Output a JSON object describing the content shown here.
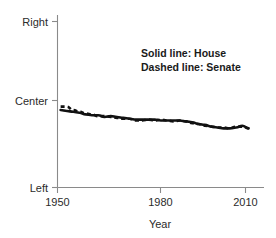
{
  "chart_data": {
    "type": "line",
    "title": "",
    "xlabel": "Year",
    "ylabel": "",
    "xlim": [
      1949,
      2012
    ],
    "ylim": [
      -1,
      1
    ],
    "grid": false,
    "legend_position": "upper-right-inside",
    "x_ticks": [
      1950,
      1980,
      2010
    ],
    "x_tick_labels": [
      "1950",
      "1980",
      "2010"
    ],
    "y_ticks": [
      1,
      0,
      -1
    ],
    "y_tick_labels": [
      "Right",
      "Center",
      "Left"
    ],
    "annotations": [
      "Solid line: House",
      "Dashed line: Senate"
    ],
    "series": [
      {
        "name": "House",
        "style": "solid",
        "color": "#111111",
        "x": [
          1951,
          1953,
          1955,
          1957,
          1959,
          1961,
          1963,
          1965,
          1967,
          1969,
          1971,
          1973,
          1975,
          1977,
          1979,
          1981,
          1983,
          1985,
          1987,
          1989,
          1991,
          1993,
          1995,
          1997,
          1999,
          2001,
          2003,
          2005,
          2007,
          2009,
          2011
        ],
        "values": [
          -0.11,
          -0.12,
          -0.13,
          -0.14,
          -0.16,
          -0.17,
          -0.17,
          -0.19,
          -0.18,
          -0.19,
          -0.2,
          -0.21,
          -0.22,
          -0.22,
          -0.22,
          -0.22,
          -0.23,
          -0.23,
          -0.23,
          -0.23,
          -0.24,
          -0.25,
          -0.27,
          -0.28,
          -0.3,
          -0.31,
          -0.32,
          -0.32,
          -0.31,
          -0.29,
          -0.32
        ]
      },
      {
        "name": "Senate",
        "style": "dashed",
        "color": "#111111",
        "x": [
          1951,
          1953,
          1955,
          1957,
          1959,
          1961,
          1963,
          1965,
          1967,
          1969,
          1971,
          1973,
          1975,
          1977,
          1979,
          1981,
          1983,
          1985,
          1987,
          1989,
          1991,
          1993,
          1995,
          1997,
          1999,
          2001,
          2003,
          2005,
          2007,
          2009,
          2011
        ],
        "values": [
          -0.07,
          -0.07,
          -0.11,
          -0.13,
          -0.15,
          -0.16,
          -0.18,
          -0.18,
          -0.19,
          -0.2,
          -0.21,
          -0.21,
          -0.23,
          -0.23,
          -0.22,
          -0.23,
          -0.22,
          -0.23,
          -0.24,
          -0.23,
          -0.24,
          -0.26,
          -0.27,
          -0.29,
          -0.3,
          -0.31,
          -0.31,
          -0.32,
          -0.3,
          -0.3,
          -0.32
        ]
      }
    ]
  },
  "axes": {
    "x_title": "Year",
    "y_top_label": "Right",
    "y_mid_label": "Center",
    "y_bottom_label": "Left",
    "x_tick_1": "1950",
    "x_tick_2": "1980",
    "x_tick_3": "2010"
  },
  "legend": {
    "line_1": "Solid line: House",
    "line_2": "Dashed line: Senate"
  },
  "colors": {
    "line": "#111111",
    "axis": "#8a8a8a",
    "text": "#2b2b2b",
    "background": "#ffffff"
  }
}
